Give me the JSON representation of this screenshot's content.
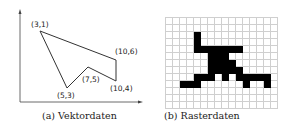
{
  "figure": {
    "panel_a": {
      "caption": "(a) Vektordaten",
      "polygon_points": [
        {
          "label": "(3,1)"
        },
        {
          "label": "(10,6)"
        },
        {
          "label": "(10,4)"
        },
        {
          "label": "(7,5)"
        },
        {
          "label": "(5,3)"
        }
      ]
    },
    "panel_b": {
      "caption": "(b) Rasterdaten",
      "grid": {
        "cols": 16,
        "rows": 13
      },
      "filled_cells": {
        "2": [
          4
        ],
        "3": [
          4
        ],
        "4": [
          4,
          5,
          6,
          7,
          8,
          9,
          10
        ],
        "5": [
          6,
          7,
          8
        ],
        "6": [
          6,
          7,
          8,
          9
        ],
        "7": [
          6,
          7,
          8,
          9,
          10
        ],
        "8": [
          4,
          5,
          6,
          8,
          10,
          11,
          12,
          13,
          14
        ],
        "9": [
          2,
          3,
          4,
          11,
          14
        ]
      }
    }
  }
}
